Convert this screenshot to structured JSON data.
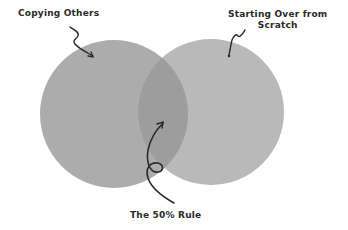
{
  "diagram": {
    "type": "venn",
    "sets": [
      {
        "id": "left",
        "label": "Copying Others",
        "color": "#acacac"
      },
      {
        "id": "right",
        "label_lines": [
          "Starting Over from",
          "Scratch"
        ],
        "color": "#b9b9b9"
      }
    ],
    "intersection": {
      "label": "The 50% Rule",
      "color": "#9d9d9d"
    },
    "arrow_color": "#2a2a2a",
    "background": "#ffffff"
  }
}
